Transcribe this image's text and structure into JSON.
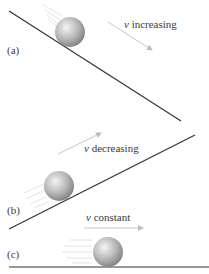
{
  "panels": [
    {
      "id": "a",
      "label": "(a)",
      "caption_var": "v",
      "caption_text": "increasing"
    },
    {
      "id": "b",
      "label": "(b)",
      "caption_var": "v",
      "caption_text": "decreasing"
    },
    {
      "id": "c",
      "label": "(c)",
      "caption_var": "v",
      "caption_text": "constant"
    }
  ],
  "colors": {
    "surface": "#333333",
    "arrow": "#c8c8c8",
    "ball_light": "#f2f2f2",
    "ball_dark": "#8a8a8a",
    "text": "#3a3a3a"
  }
}
